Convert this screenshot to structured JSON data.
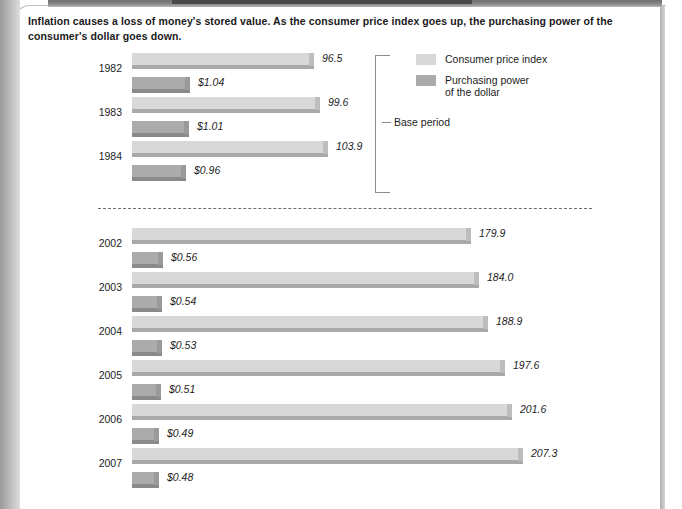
{
  "caption": "Inflation causes a loss of money's stored value. As the consumer price index goes up, the purchasing power of the consumer's dollar goes down.",
  "legend": {
    "items": [
      {
        "label": "Consumer price index",
        "color": "#d8d8d8",
        "key": "cpi"
      },
      {
        "label": "Purchasing power\nof the dollar",
        "color": "#ababab",
        "key": "ppd"
      }
    ]
  },
  "annotations": {
    "base_period_label": "Base period"
  },
  "chart_data": {
    "type": "bar",
    "title": "Inflation causes a loss of money's stored value. As the consumer price index goes up, the purchasing power of the consumer's dollar goes down.",
    "orientation": "horizontal",
    "grouped": true,
    "xlabel": "",
    "ylabel": "",
    "grid": false,
    "legend_position": "top-right",
    "categories": [
      "1982",
      "1983",
      "1984",
      "2002",
      "2003",
      "2004",
      "2005",
      "2006",
      "2007"
    ],
    "series": [
      {
        "name": "Consumer price index",
        "color": "#d8d8d8",
        "values": [
          96.5,
          99.6,
          103.9,
          179.9,
          184.0,
          188.9,
          197.6,
          201.6,
          207.3
        ],
        "labels": [
          "96.5",
          "99.6",
          "103.9",
          "179.9",
          "184.0",
          "188.9",
          "197.6",
          "201.6",
          "207.3"
        ],
        "axis_max": 207.3
      },
      {
        "name": "Purchasing power of the dollar",
        "color": "#ababab",
        "values": [
          1.04,
          1.01,
          0.96,
          0.56,
          0.54,
          0.53,
          0.51,
          0.49,
          0.48
        ],
        "labels": [
          "$1.04",
          "$1.01",
          "$0.96",
          "$0.56",
          "$0.54",
          "$0.53",
          "$0.51",
          "$0.49",
          "$0.48"
        ],
        "axis_max": 1.04
      }
    ],
    "annotations": [
      {
        "text": "Base period",
        "applies_to": [
          "1982",
          "1983",
          "1984"
        ]
      },
      {
        "text": "dashed break between 1984 and 2002",
        "type": "axis-break"
      }
    ]
  },
  "layout": {
    "bar_origin_x": 132,
    "cpi_px_per_unit": 1.886,
    "ppd_px_per_unit": 56,
    "groups": [
      {
        "category": "1982",
        "top": 53,
        "year_top": 62
      },
      {
        "category": "1983",
        "top": 97,
        "year_top": 106
      },
      {
        "category": "1984",
        "top": 141,
        "year_top": 150
      },
      {
        "category": "2002",
        "top": 228,
        "year_top": 237
      },
      {
        "category": "2003",
        "top": 272,
        "year_top": 281
      },
      {
        "category": "2004",
        "top": 316,
        "year_top": 325
      },
      {
        "category": "2005",
        "top": 360,
        "year_top": 369
      },
      {
        "category": "2006",
        "top": 404,
        "year_top": 413
      },
      {
        "category": "2007",
        "top": 448,
        "year_top": 457
      }
    ],
    "sub_offset": 24
  }
}
